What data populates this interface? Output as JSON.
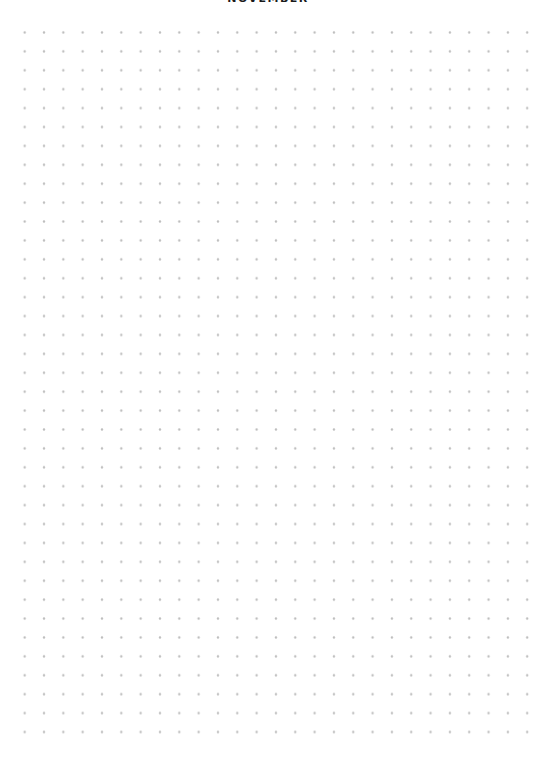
{
  "page": {
    "title": "NOVEMBER",
    "title_color": "#1a1a1a",
    "background_color": "#ffffff"
  },
  "dot_grid": {
    "rows": 38,
    "cols": 27,
    "dot_color": "#bdbdbd"
  }
}
